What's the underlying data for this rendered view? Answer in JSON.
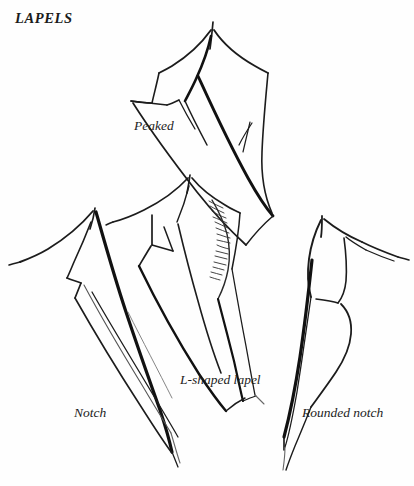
{
  "page": {
    "title": "LAPELS",
    "background_color": "#ffffff",
    "ink_color": "#1a1a1a",
    "width": 414,
    "height": 486
  },
  "figures": [
    {
      "id": "peaked",
      "label": "Peaked",
      "description": "Peaked lapel with upward-pointing peak and long tapering point"
    },
    {
      "id": "notch",
      "label": "Notch",
      "description": "Notch lapel with stepped notch between collar and lapel"
    },
    {
      "id": "l-shaped",
      "label": "L-shaped lapel",
      "description": "L-shaped lapel with hatched shading along the front edge"
    },
    {
      "id": "rounded-notch",
      "label": "Rounded notch",
      "description": "Rounded notch lapel with curved collar and lapel edges"
    }
  ],
  "labels": {
    "title": "LAPELS",
    "peaked": "Peaked",
    "notch": "Notch",
    "l_shaped": "L-shaped lapel",
    "rounded_notch": "Rounded notch"
  }
}
